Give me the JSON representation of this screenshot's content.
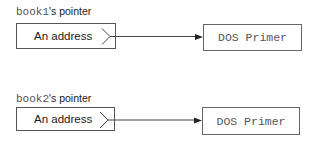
{
  "diagram": {
    "pointers": [
      {
        "variable": "book1",
        "label_suffix": "'s pointer",
        "value": "An address",
        "target": "DOS Primer"
      },
      {
        "variable": "book2",
        "label_suffix": "'s pointer",
        "value": "An address",
        "target": "DOS Primer"
      }
    ],
    "colors": {
      "line": "#333333",
      "box_border": "#555555",
      "mono_text": "#555555"
    }
  }
}
